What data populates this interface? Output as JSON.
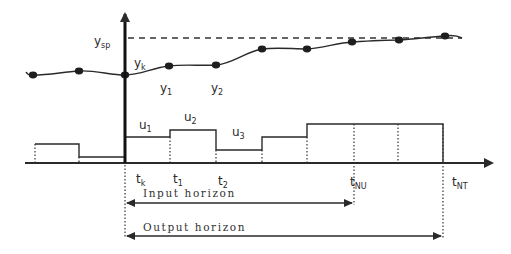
{
  "diagram": {
    "labels": {
      "setpoint": {
        "base": "y",
        "sub": "sp"
      },
      "current_output": {
        "base": "y",
        "sub": "k"
      },
      "pred_output_1": {
        "base": "y",
        "sub": "1"
      },
      "pred_output_2": {
        "base": "y",
        "sub": "2"
      },
      "input_1": {
        "base": "u",
        "sub": "1"
      },
      "input_2": {
        "base": "u",
        "sub": "2"
      },
      "input_3": {
        "base": "u",
        "sub": "3"
      },
      "time_k": {
        "base": "t",
        "sub": "k"
      },
      "time_1": {
        "base": "t",
        "sub": "1"
      },
      "time_2": {
        "base": "t",
        "sub": "2"
      },
      "time_NU": {
        "base": "t",
        "sub": "NU"
      },
      "time_NT": {
        "base": "t",
        "sub": "NT"
      }
    },
    "horizons": {
      "input": "Input horizon",
      "output": "Output horizon"
    },
    "colors": {
      "line": "#2a2a2a",
      "marker": "#1e1e1e",
      "background": "#ffffff"
    },
    "output_points": [
      [
        33,
        75
      ],
      [
        79,
        71
      ],
      [
        125,
        75
      ],
      [
        169,
        66
      ],
      [
        216,
        65
      ],
      [
        262,
        49
      ],
      [
        307,
        49
      ],
      [
        352,
        42
      ],
      [
        399,
        40
      ],
      [
        445,
        36
      ]
    ],
    "input_steps": [
      {
        "x0": 35,
        "x1": 79,
        "y": 144
      },
      {
        "x0": 79,
        "x1": 125,
        "y": 157
      },
      {
        "x0": 125,
        "x1": 170,
        "y": 137
      },
      {
        "x0": 170,
        "x1": 216,
        "y": 130
      },
      {
        "x0": 216,
        "x1": 262,
        "y": 150
      },
      {
        "x0": 262,
        "x1": 307,
        "y": 137
      },
      {
        "x0": 307,
        "x1": 443,
        "y": 124
      }
    ]
  }
}
